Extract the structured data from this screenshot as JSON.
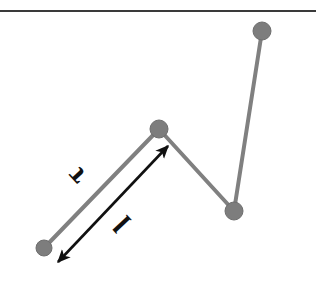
{
  "figure": {
    "width": 324,
    "height": 288,
    "background_color": "#ffffff"
  },
  "colors": {
    "ceiling": "#3a3a3a",
    "rod": "#808080",
    "node_fill": "#7d7d7d",
    "node_stroke": "#6e6e6e",
    "annotation": "#111111"
  },
  "ceiling": {
    "label": "ceiling-line",
    "x1": 0,
    "y1": 11,
    "x2": 316,
    "y2": 11,
    "thickness": 2
  },
  "nodes": [
    {
      "name": "joint-bottom-left",
      "cx": 44,
      "cy": 248,
      "r": 8
    },
    {
      "name": "joint-peak",
      "cx": 159,
      "cy": 129,
      "r": 9
    },
    {
      "name": "joint-valley",
      "cx": 234,
      "cy": 211,
      "r": 9
    },
    {
      "name": "joint-top-right",
      "cx": 262,
      "cy": 31,
      "r": 9
    }
  ],
  "rods": [
    {
      "name": "rod-1",
      "x1": 44,
      "y1": 248,
      "x2": 159,
      "y2": 129,
      "thickness": 4
    },
    {
      "name": "rod-2",
      "x1": 159,
      "y1": 129,
      "x2": 234,
      "y2": 211,
      "thickness": 4
    },
    {
      "name": "rod-3",
      "x1": 234,
      "y1": 211,
      "x2": 262,
      "y2": 31,
      "thickness": 4
    }
  ],
  "annotation_arrow": {
    "name": "length-double-arrow",
    "x1": 58,
    "y1": 262,
    "x2": 168,
    "y2": 146,
    "thickness": 2.6,
    "double_headed": true
  },
  "labels": [
    {
      "name": "torque-label",
      "text": "τ",
      "x": 78,
      "y": 175,
      "rotation": -133,
      "font_size": 30
    },
    {
      "name": "length-label",
      "text": "l",
      "x": 124,
      "y": 222,
      "rotation": -133,
      "font_size": 30
    }
  ]
}
